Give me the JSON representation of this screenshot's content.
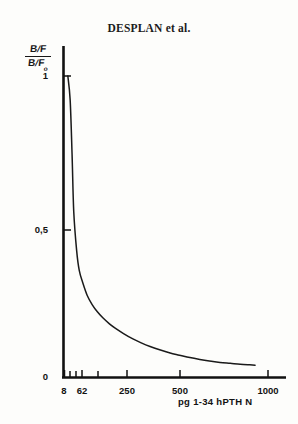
{
  "page": {
    "running_head": "DESPLAN et al."
  },
  "figure": {
    "y_axis": {
      "label_numerator_b": "B",
      "label_numerator_f": "F",
      "label_denominator_b": "B",
      "label_denominator_f": "F",
      "label_denominator_sub": "o",
      "ticks": [
        "1",
        "0,5",
        "0"
      ]
    },
    "x_axis": {
      "caption": "pg 1-34 hPTH  N",
      "ticks": [
        "8",
        "62",
        "250",
        "500",
        "1000"
      ]
    }
  },
  "chart_data": {
    "type": "line",
    "title": "DESPLAN et al.",
    "xlabel": "pg 1-34 hPTH  N",
    "ylabel": "B/F / B/Fo",
    "xlim": [
      0,
      1000
    ],
    "ylim": [
      0,
      1.12
    ],
    "xticks": [
      8,
      62,
      250,
      500,
      1000
    ],
    "xticklabels": [
      "8",
      "62",
      "250",
      "500",
      "1000"
    ],
    "yticks": [
      0,
      0.5,
      1
    ],
    "yticklabels": [
      "0",
      "0,5",
      "1"
    ],
    "x_minor_ticks": [
      8,
      16,
      31,
      62,
      125
    ],
    "grid": false,
    "legend": false,
    "axis_style": "left-and-bottom-spines",
    "series": [
      {
        "name": "B/F ratio vs hPTH dose",
        "x": [
          2,
          4,
          6,
          8,
          12,
          16,
          22,
          31,
          42,
          55,
          70,
          90,
          110,
          140,
          175,
          210,
          250,
          300,
          350,
          400,
          460,
          520,
          580,
          650,
          720,
          790,
          860,
          900
        ],
        "y": [
          1.0,
          0.92,
          0.74,
          0.55,
          0.42,
          0.355,
          0.315,
          0.272,
          0.242,
          0.218,
          0.198,
          0.178,
          0.163,
          0.145,
          0.128,
          0.115,
          0.103,
          0.091,
          0.081,
          0.074,
          0.066,
          0.06,
          0.055,
          0.05,
          0.047,
          0.044,
          0.042,
          0.041
        ]
      }
    ]
  }
}
